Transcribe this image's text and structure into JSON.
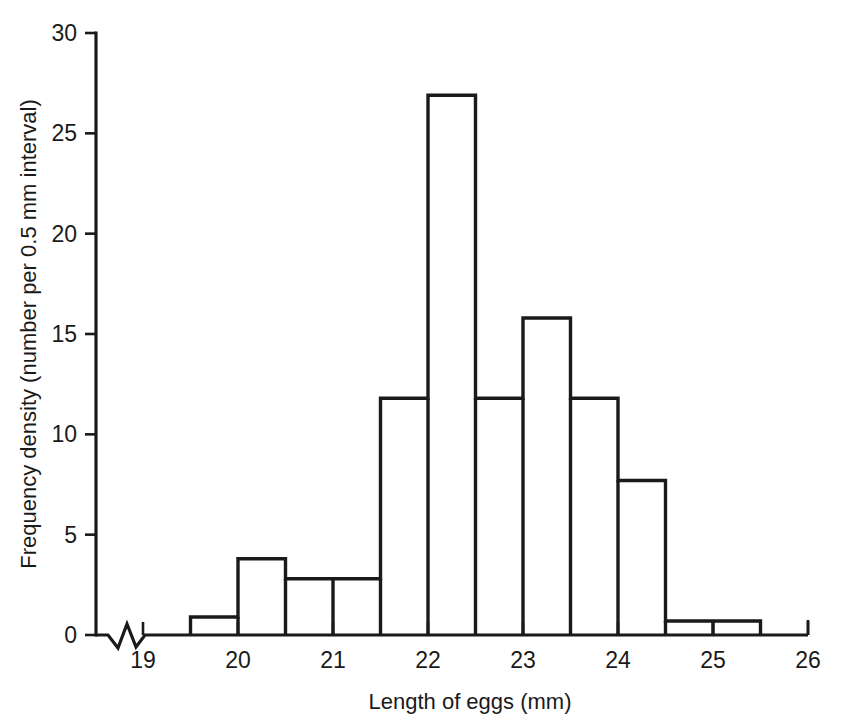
{
  "chart_data": {
    "type": "bar",
    "title": "",
    "subtitle": "",
    "xlabel": "Length of eggs (mm)",
    "ylabel": "Frequency density (number per 0.5 mm interval)",
    "xlim": [
      18.65,
      26.0
    ],
    "ylim": [
      0,
      30
    ],
    "grid": false,
    "legend": null,
    "legend_position": "none",
    "bin_width": 0.5,
    "x_axis_has_break": true,
    "x_axis_break_note": "zigzag break symbol on x-axis between origin and 19",
    "xticks": [
      19,
      20,
      21,
      22,
      23,
      24,
      25,
      26
    ],
    "xtick_labels": [
      "19",
      "20",
      "21",
      "22",
      "23",
      "24",
      "25",
      "26"
    ],
    "yticks": [
      0,
      5,
      10,
      15,
      20,
      25,
      30
    ],
    "ytick_labels": [
      "0",
      "5",
      "10",
      "15",
      "20",
      "25",
      "30"
    ],
    "bin_edges": [
      19.5,
      20.0,
      20.5,
      21.0,
      21.5,
      22.0,
      22.5,
      23.0,
      23.5,
      24.0,
      24.5,
      25.0,
      25.5
    ],
    "categories": [
      "19.5-20.0",
      "20.0-20.5",
      "20.5-21.0",
      "21.0-21.5",
      "21.5-22.0",
      "22.0-22.5",
      "22.5-23.0",
      "23.0-23.5",
      "23.5-24.0",
      "24.0-24.5",
      "24.5-25.0",
      "25.0-25.5"
    ],
    "values": [
      0.9,
      3.8,
      2.8,
      2.8,
      11.8,
      26.9,
      11.8,
      15.8,
      11.8,
      7.7,
      0.7,
      0.7
    ],
    "colors": {
      "outline": "#1a1a1a",
      "fill": "#ffffff",
      "background": "#ffffff",
      "text": "#1a1a1a"
    }
  }
}
